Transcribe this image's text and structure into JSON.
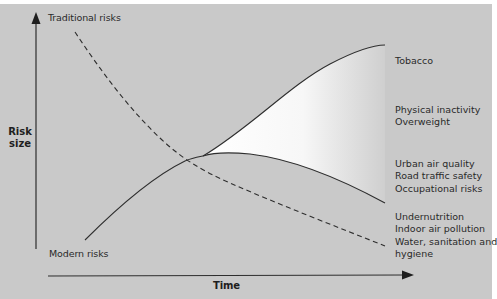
{
  "diagram": {
    "title": "",
    "axes": {
      "y_label_line1": "Risk",
      "y_label_line2": "size",
      "x_label": "Time"
    },
    "curves": {
      "traditional": {
        "label": "Traditional risks",
        "style": "dashed"
      },
      "modern": {
        "label": "Modern risks",
        "style": "solid"
      }
    },
    "right_labels": {
      "tobacco": [
        "Tobacco"
      ],
      "physical": [
        "Physical inactivity",
        "Overweight"
      ],
      "urban": [
        "Urban air quality",
        "Road traffic safety",
        "Occupational risks"
      ],
      "traditional_items": [
        "Undernutrition",
        "Indoor air pollution",
        "Water, sanitation and",
        "hygiene"
      ]
    },
    "colors": {
      "background": "#c9c9c9",
      "line": "#2e2e2e",
      "fill_highlight": "#ffffff"
    }
  }
}
